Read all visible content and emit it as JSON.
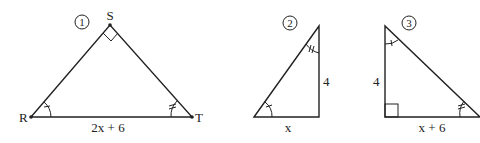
{
  "figures": [
    {
      "id": "1",
      "badge": "1",
      "vertices": {
        "top": "S",
        "left": "R",
        "right": "T"
      },
      "right_angle_at": "S",
      "sides": {
        "base": "2x + 6"
      },
      "angle_marks": {
        "R": "single",
        "T": "double"
      }
    },
    {
      "id": "2",
      "badge": "2",
      "right_angle_at": "bottom-right",
      "sides": {
        "base": "x",
        "vertical": "4"
      },
      "angle_marks": {
        "bottom-left": "single",
        "top": "double"
      }
    },
    {
      "id": "3",
      "badge": "3",
      "right_angle_at": "bottom-left",
      "sides": {
        "base": "x + 6",
        "vertical": "4"
      },
      "angle_marks": {
        "top": "single",
        "bottom-right": "double"
      }
    }
  ],
  "colors": {
    "stroke": "#222222",
    "background": "#ffffff"
  }
}
